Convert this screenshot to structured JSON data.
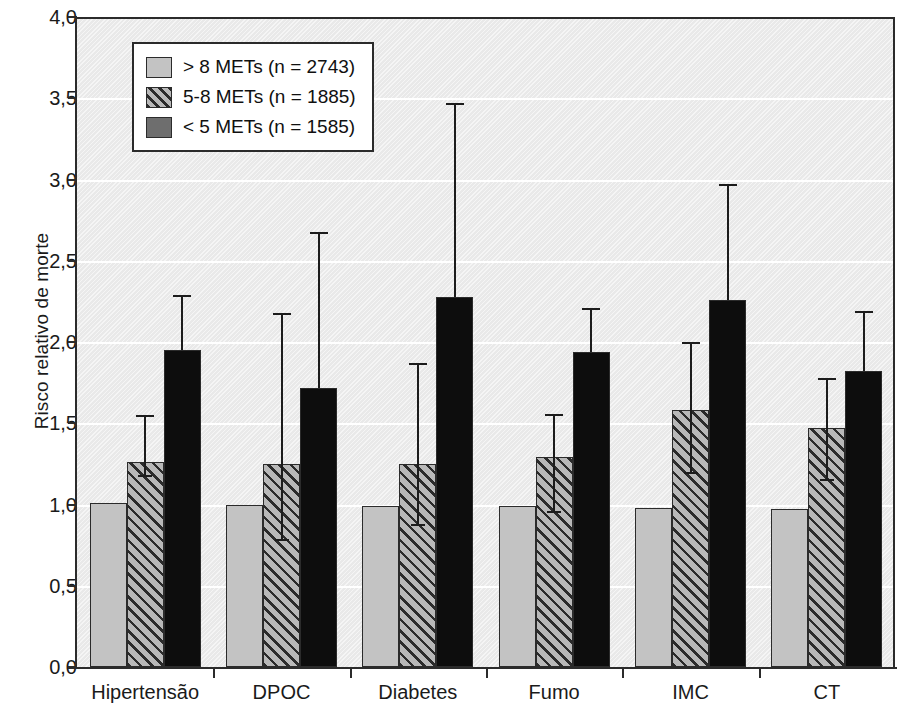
{
  "chart_data": {
    "type": "bar",
    "title": "",
    "xlabel": "",
    "ylabel": "Risco relativo de morte",
    "ylim": [
      0.0,
      4.0
    ],
    "ytick_step": 0.5,
    "grid": true,
    "legend_position": "top-left",
    "decimal_separator": ",",
    "categories": [
      "Hipertensão",
      "DPOC",
      "Diabetes",
      "Fumo",
      "IMC",
      "CT"
    ],
    "ytick_labels": [
      "0,0",
      "0,5",
      "1,0",
      "1,5",
      "2,0",
      "2,5",
      "3,0",
      "3,5",
      "4,0"
    ],
    "ytick_values": [
      0.0,
      0.5,
      1.0,
      1.5,
      2.0,
      2.5,
      3.0,
      3.5,
      4.0
    ],
    "series": [
      {
        "name": "> 8 METs (n = 2743)",
        "n": 2743,
        "fill": "light-gray",
        "color": "#c3c3c3",
        "values": [
          1.01,
          1.0,
          0.99,
          0.99,
          0.98,
          0.97
        ],
        "error_low": [
          null,
          null,
          null,
          null,
          null,
          null
        ],
        "error_high": [
          null,
          null,
          null,
          null,
          null,
          null
        ]
      },
      {
        "name": "5-8 METs (n = 1885)",
        "n": 1885,
        "fill": "hatched",
        "color": "#b8b8b8",
        "values": [
          1.26,
          1.25,
          1.25,
          1.29,
          1.58,
          1.47
        ],
        "error_low": [
          1.18,
          0.79,
          0.88,
          0.96,
          1.2,
          1.16
        ],
        "error_high": [
          1.55,
          2.18,
          1.87,
          1.56,
          2.0,
          1.78
        ]
      },
      {
        "name": "< 5 METs (n = 1585)",
        "n": 1585,
        "fill": "black",
        "color": "#0d0d0d",
        "values": [
          1.95,
          1.72,
          2.28,
          1.94,
          2.26,
          1.82
        ],
        "error_low": [
          null,
          null,
          null,
          null,
          null,
          null
        ],
        "error_high": [
          2.29,
          2.68,
          3.47,
          2.21,
          2.97,
          2.19
        ]
      }
    ]
  },
  "legend": {
    "items": [
      {
        "label": "> 8 METs (n = 2743)"
      },
      {
        "label": "5-8 METs (n = 1885)"
      },
      {
        "label": "< 5 METs (n = 1585)"
      }
    ]
  }
}
